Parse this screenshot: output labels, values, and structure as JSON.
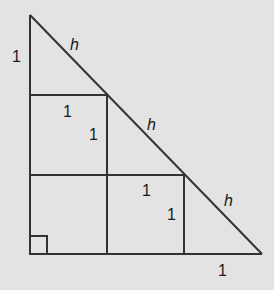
{
  "diagram": {
    "labels": {
      "left_leg_top": "1",
      "hyp_top": "h",
      "square1_top": "1",
      "square1_side": "1",
      "hyp_middle": "h",
      "square2_top": "1",
      "square2_side": "1",
      "hyp_bottom": "h",
      "bottom_right": "1"
    },
    "colors": {
      "background": "#e3e3e3",
      "stroke": "#333333",
      "text": "#1a1a1a"
    }
  }
}
